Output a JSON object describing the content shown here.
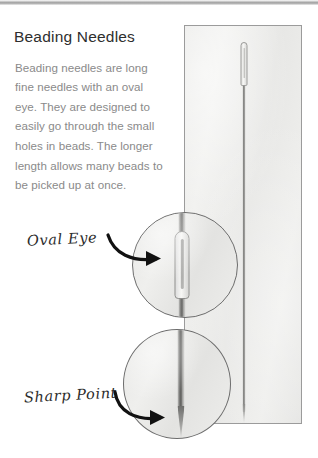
{
  "page": {
    "title": "Beading Needles",
    "body": "Beading needles are long fine needles with an oval eye. They are designed to easily go through the small holes in beads. The longer length allows many beads to be picked up at once."
  },
  "photo": {
    "alt_name": "beading-needle-photo",
    "background_color": "#eaeae8",
    "border_color": "#9b9b9b",
    "needle_color": "#6f6f6d"
  },
  "annotations": [
    {
      "id": "oval-eye",
      "label": "Oval Eye",
      "arrow": "curved-arrow-right",
      "target": "needle-eye"
    },
    {
      "id": "sharp-point",
      "label": "Sharp Point",
      "arrow": "curved-arrow-right",
      "target": "needle-point"
    }
  ],
  "magnifiers": [
    {
      "id": "magnifier-oval-eye",
      "shows": "needle eye close-up"
    },
    {
      "id": "magnifier-sharp-point",
      "shows": "needle point close-up"
    }
  ],
  "colors": {
    "title_text": "#2e2e2e",
    "body_text": "#8a8a8a",
    "annotation_text": "#2b2b2b",
    "arrow": "#111111"
  }
}
